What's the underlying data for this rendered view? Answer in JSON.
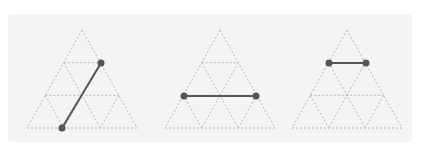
{
  "diagram": {
    "colors": {
      "grid": "#b5b5b5",
      "segment": "#555555",
      "point": "#555555",
      "background": "#f4f4f4"
    },
    "grid_divisions": 3,
    "triangles": [
      {
        "apex": [
          82,
          30
        ],
        "base_left": [
          27,
          128
        ],
        "base_right": [
          137,
          128
        ],
        "segment": {
          "from": [
            62,
            128
          ],
          "to": [
            101,
            63
          ]
        }
      },
      {
        "apex": [
          220,
          30
        ],
        "base_left": [
          165,
          128
        ],
        "base_right": [
          275,
          128
        ],
        "segment": {
          "from": [
            184,
            96
          ],
          "to": [
            256,
            96
          ]
        }
      },
      {
        "apex": [
          347,
          30
        ],
        "base_left": [
          292,
          128
        ],
        "base_right": [
          402,
          128
        ],
        "segment": {
          "from": [
            329,
            63
          ],
          "to": [
            366,
            63
          ]
        }
      }
    ]
  }
}
